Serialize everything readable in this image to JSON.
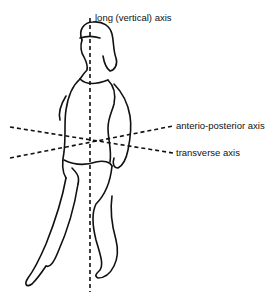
{
  "diagram": {
    "axes": [
      {
        "id": "long",
        "label": "long (vertical) axis"
      },
      {
        "id": "ap",
        "label": "anterio-posterior axis"
      },
      {
        "id": "transverse",
        "label": "transverse axis"
      }
    ],
    "colors": {
      "line": "#111111",
      "background": "#ffffff"
    }
  }
}
